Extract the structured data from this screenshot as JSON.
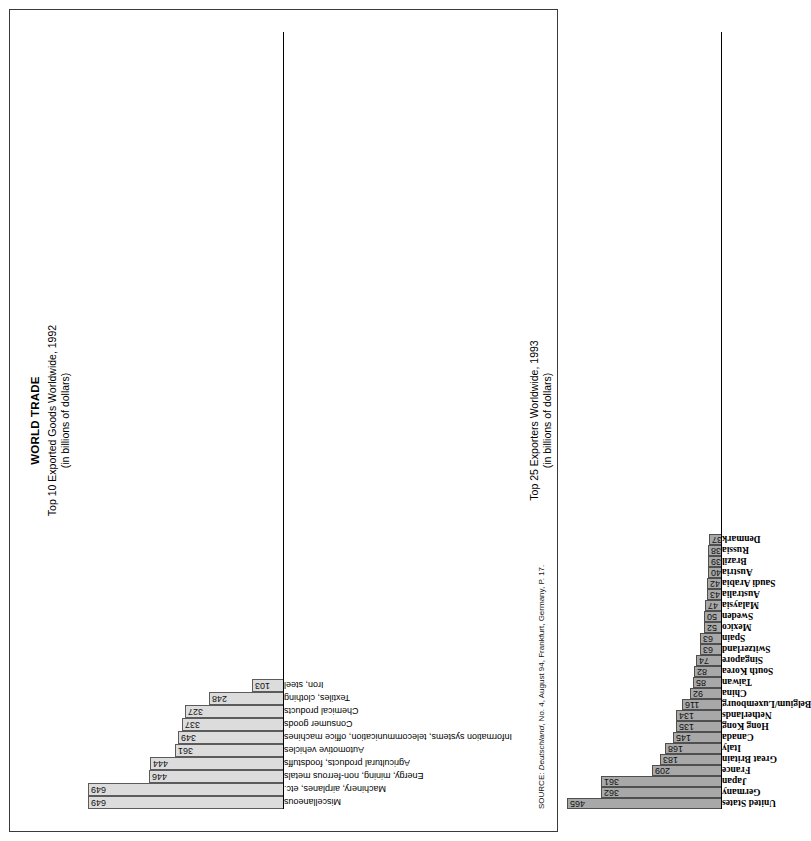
{
  "page": {
    "main_title": "WORLD TRADE",
    "source_prefix": "SOURCE: ",
    "source_italic": "Deutschland",
    "source_rest": ", No. 4, August 94, Frankfurt, Germany, P. 17."
  },
  "chart_data": [
    {
      "type": "bar",
      "id": "top10-exported-goods",
      "title": "Top 10 Exported Goods Worldwide, 1992",
      "subtitle": "(in billions of dollars)",
      "xlabel": "",
      "ylabel": "",
      "unit": "billions of dollars",
      "ylim": [
        0,
        700
      ],
      "grid": false,
      "legend": "none",
      "bar_color": "#dcdcdc",
      "categories": [
        "Miscellaneous",
        "Machinery, airplanes, etc.",
        "Energy, mining, non-ferrous metals",
        "Agricultural products, foodstuffs",
        "Automotive vehicles",
        "Information systems, telecommunication, office machines",
        "Consumer goods",
        "Chemical products",
        "Textiles, clothing",
        "Iron, steel"
      ],
      "values": [
        649,
        649,
        446,
        444,
        361,
        349,
        337,
        327,
        248,
        103
      ]
    },
    {
      "type": "bar",
      "id": "top25-exporters",
      "title": "Top 25 Exporters Worldwide, 1993",
      "subtitle": "(in billions of dollars)",
      "xlabel": "",
      "ylabel": "",
      "unit": "billions of dollars",
      "ylim": [
        0,
        500
      ],
      "grid": false,
      "legend": "none",
      "bar_color": "#a8a8a8",
      "categories": [
        "United States",
        "Germany",
        "Japan",
        "France",
        "Great Britain",
        "Italy",
        "Canada",
        "Hong Kong",
        "Netherlands",
        "Belgium/Luxembourg",
        "China",
        "Taiwan",
        "South Korea",
        "Singapore",
        "Switzerland",
        "Spain",
        "Mexico",
        "Sweden",
        "Malaysia",
        "Australia",
        "Saudi Arabia",
        "Austria",
        "Brazil",
        "Russia",
        "Denmark"
      ],
      "values": [
        465,
        362,
        361,
        209,
        183,
        168,
        145,
        135,
        134,
        116,
        92,
        85,
        82,
        74,
        63,
        63,
        52,
        50,
        47,
        43,
        42,
        40,
        39,
        38,
        37
      ]
    }
  ]
}
